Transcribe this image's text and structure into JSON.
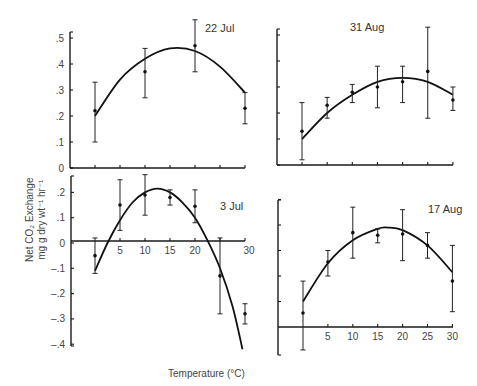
{
  "chart_data": [
    {
      "type": "scatter",
      "title": "22 Jul",
      "xlabel": "Temperature (°C)",
      "ylabel": "Net CO2 Exchange mg g dry wt-1 hr-1",
      "xlim": [
        0,
        30
      ],
      "ylim": [
        0,
        0.5
      ],
      "yticks": [
        ".5",
        ".4",
        ".3",
        ".2",
        ".1",
        "0"
      ],
      "x": [
        0,
        10,
        20,
        30
      ],
      "values": [
        0.22,
        0.37,
        0.47,
        0.23
      ],
      "err_low": [
        0.1,
        0.27,
        0.37,
        0.17
      ],
      "err_high": [
        0.33,
        0.46,
        0.57,
        0.29
      ],
      "fit_curve": {
        "x": [
          0,
          5,
          10,
          15,
          20,
          25,
          30
        ],
        "y": [
          0.2,
          0.34,
          0.42,
          0.46,
          0.45,
          0.39,
          0.29
        ]
      }
    },
    {
      "type": "scatter",
      "title": "31 Aug",
      "xlim": [
        0,
        30
      ],
      "ylim": [
        0,
        0.5
      ],
      "x": [
        0,
        5,
        10,
        15,
        20,
        25,
        30
      ],
      "values": [
        0.13,
        0.23,
        0.28,
        0.3,
        0.32,
        0.36,
        0.25
      ],
      "err_low": [
        0.02,
        0.18,
        0.24,
        0.22,
        0.24,
        0.18,
        0.21
      ],
      "err_high": [
        0.24,
        0.26,
        0.31,
        0.38,
        0.38,
        0.53,
        0.3
      ],
      "fit_curve": {
        "x": [
          0,
          5,
          10,
          15,
          20,
          25,
          30
        ],
        "y": [
          0.1,
          0.2,
          0.27,
          0.32,
          0.335,
          0.32,
          0.27
        ]
      }
    },
    {
      "type": "scatter",
      "title": "3 Jul",
      "xlim": [
        0,
        30
      ],
      "ylim": [
        -0.4,
        0.25
      ],
      "yticks": [
        ".2",
        ".1",
        "0",
        "-.1",
        "-.2",
        "-.3",
        "-.4"
      ],
      "xticks": [
        "5",
        "10",
        "15",
        "20",
        "30"
      ],
      "x": [
        0,
        5,
        10,
        15,
        20,
        25,
        30
      ],
      "values": [
        -0.05,
        0.15,
        0.19,
        0.18,
        0.145,
        -0.13,
        -0.28
      ],
      "err_low": [
        -0.12,
        0.05,
        0.11,
        0.15,
        0.08,
        -0.28,
        -0.32
      ],
      "err_high": [
        0.02,
        0.25,
        0.27,
        0.21,
        0.21,
        0.02,
        -0.24
      ],
      "fit_curve": {
        "x": [
          0,
          2.5,
          5,
          7.5,
          10,
          12.5,
          15,
          17.5,
          20,
          22.5,
          25,
          27.5,
          29.5
        ],
        "y": [
          -0.11,
          0.0,
          0.09,
          0.16,
          0.2,
          0.215,
          0.2,
          0.16,
          0.1,
          0.01,
          -0.1,
          -0.25,
          -0.42
        ]
      }
    },
    {
      "type": "scatter",
      "title": "17 Aug",
      "xlim": [
        0,
        30
      ],
      "ylim": [
        -0.08,
        0.5
      ],
      "xticks": [
        "5",
        "10",
        "15",
        "20",
        "25",
        "30"
      ],
      "x": [
        0,
        5,
        10,
        15,
        20,
        25,
        30
      ],
      "values": [
        0.055,
        0.255,
        0.37,
        0.36,
        0.365,
        0.32,
        0.18
      ],
      "err_low": [
        -0.09,
        0.2,
        0.27,
        0.33,
        0.26,
        0.27,
        0.06
      ],
      "err_high": [
        0.18,
        0.3,
        0.47,
        0.385,
        0.46,
        0.37,
        0.32
      ],
      "fit_curve": {
        "x": [
          0,
          5,
          10,
          15,
          17,
          20,
          25,
          30
        ],
        "y": [
          0.1,
          0.25,
          0.34,
          0.385,
          0.39,
          0.38,
          0.32,
          0.215
        ]
      }
    }
  ],
  "labels": {
    "ylabel_line1": "Net CO₂ Exchange",
    "ylabel_line2": "mg g dry wt⁻¹ hr⁻¹",
    "xlabel": "Temperature (°C)"
  },
  "layout": {
    "panels": [
      {
        "x0": 95,
        "xs": 5.0,
        "y0": 168,
        "ys": 260,
        "axisX": 70,
        "axisTop": 32,
        "axisBottom": 168,
        "xEnd": 245,
        "xAxisY": 168,
        "titleX": 205,
        "titleY": 32,
        "ytickVals": [
          0.5,
          0.4,
          0.3,
          0.2,
          0.1,
          0
        ],
        "xtickVals": [
          0,
          5,
          10,
          15,
          20,
          25,
          30
        ],
        "showXLabels": false
      },
      {
        "x0": 302,
        "xs": 5.03,
        "y0": 165,
        "ys": 260,
        "axisX": 277,
        "axisTop": 29,
        "axisBottom": 165,
        "xEnd": 453,
        "xAxisY": 165,
        "titleX": 350,
        "titleY": 31,
        "ytickVals": [
          0.5,
          0.4,
          0.3,
          0.2,
          0.1
        ],
        "xtickVals": [
          0,
          5,
          10,
          15,
          20,
          25,
          30
        ],
        "showXLabels": false
      },
      {
        "x0": 95,
        "xs": 5.0,
        "y0": 243,
        "ys": 253,
        "axisX": 71,
        "axisTop": 176,
        "axisBottom": 346,
        "xEnd": 245,
        "xAxisY": 241,
        "titleX": 220,
        "titleY": 210,
        "ytickVals": [
          0.2,
          0.1,
          0,
          -0.1,
          -0.2,
          -0.3,
          -0.4
        ],
        "xtickVals": [
          5,
          10,
          15,
          20,
          25,
          30
        ],
        "showXLabels": true
      },
      {
        "x0": 303,
        "xs": 4.98,
        "y0": 327,
        "ys": 255,
        "axisX": 278,
        "axisTop": 200,
        "axisBottom": 355,
        "xEnd": 453,
        "xAxisY": 327,
        "titleX": 428,
        "titleY": 213,
        "ytickVals": [
          0.5,
          0.4,
          0.3,
          0.2,
          0.1
        ],
        "xtickVals": [
          5,
          10,
          15,
          20,
          25,
          30
        ],
        "showXLabels": true
      }
    ]
  }
}
